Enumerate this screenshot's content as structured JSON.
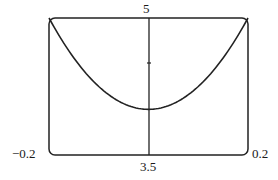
{
  "chart_data": {
    "type": "line",
    "title": "",
    "xlabel": "",
    "ylabel": "",
    "xlim": [
      -0.2,
      0.2
    ],
    "ylim": [
      3.5,
      5
    ],
    "x_tick_labels": [
      "-0.2",
      "0.2"
    ],
    "y_tick_labels": [
      "3.5",
      "5"
    ],
    "y_axis_minor_ticks": [
      4.5
    ],
    "grid": false,
    "legend": null,
    "series": [
      {
        "name": "curve",
        "x": [
          -0.2,
          -0.15,
          -0.1,
          -0.05,
          0.0,
          0.05,
          0.1,
          0.15,
          0.2
        ],
        "y": [
          5.0,
          4.56,
          4.25,
          4.06,
          4.0,
          4.06,
          4.25,
          4.56,
          5.0
        ]
      }
    ]
  },
  "labels": {
    "x_min": "−0.2",
    "x_max": "0.2",
    "y_min": "3.5",
    "y_max": "5"
  }
}
